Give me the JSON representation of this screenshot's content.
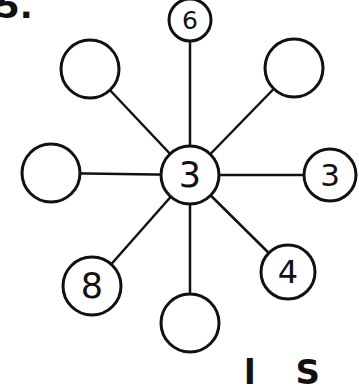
{
  "problem": {
    "label": "5.",
    "bottom_text_partial": "l S"
  },
  "diagram": {
    "type": "star-number-web",
    "stroke_color": "#111111",
    "background": "#ffffff",
    "center": {
      "value": "3",
      "x": 190,
      "y": 175,
      "r": 29
    },
    "nodes": [
      {
        "id": "top",
        "value": "6",
        "x": 190,
        "y": 20,
        "r": 21
      },
      {
        "id": "top-right",
        "value": "",
        "x": 294,
        "y": 68,
        "r": 29
      },
      {
        "id": "right",
        "value": "3",
        "x": 330,
        "y": 175,
        "r": 26
      },
      {
        "id": "bottom-right",
        "value": "4",
        "x": 288,
        "y": 272,
        "r": 27
      },
      {
        "id": "bottom",
        "value": "",
        "x": 190,
        "y": 323,
        "r": 29
      },
      {
        "id": "bottom-left",
        "value": "8",
        "x": 92,
        "y": 286,
        "r": 29
      },
      {
        "id": "left",
        "value": "",
        "x": 51,
        "y": 173,
        "r": 29
      },
      {
        "id": "top-left",
        "value": "",
        "x": 90,
        "y": 69,
        "r": 29
      }
    ]
  }
}
